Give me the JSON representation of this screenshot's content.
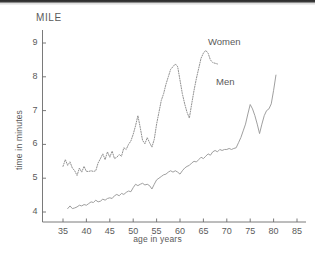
{
  "figure": {
    "title": "MILE",
    "background": "#ffffff",
    "ink_color": "#6b6b6b"
  },
  "annotations": {
    "women_label": "Women",
    "men_label": "Men"
  },
  "chart_data": {
    "type": "line",
    "title": "MILE",
    "xlabel": "age in years",
    "ylabel": "time in minutes",
    "xlim": [
      31,
      88
    ],
    "ylim": [
      3.55,
      9.4
    ],
    "xticks": [
      35,
      40,
      45,
      50,
      55,
      60,
      65,
      70,
      75,
      80,
      85
    ],
    "yticks": [
      4,
      5,
      6,
      7,
      8,
      9
    ],
    "grid": false,
    "legend": "inline-annotation",
    "series": [
      {
        "name": "Women",
        "linestyle": "dotted",
        "color": "#8a8a8a",
        "x": [
          35,
          35.5,
          36,
          36.5,
          37,
          37.5,
          38,
          38.5,
          39,
          39.5,
          40,
          40.5,
          41,
          41.5,
          42,
          42.5,
          43,
          43.5,
          44,
          44.5,
          45,
          45.5,
          46,
          46.5,
          47,
          47.5,
          48,
          48.5,
          49,
          49.5,
          50,
          50.5,
          51,
          51.5,
          52,
          52.5,
          53,
          53.5,
          54,
          54.5,
          55,
          55.5,
          56,
          56.5,
          57,
          57.5,
          58,
          58.5,
          59,
          59.5,
          60,
          60.5,
          61,
          61.5,
          62,
          62.5,
          63,
          63.5,
          64,
          64.5,
          65,
          65.5,
          66,
          66.5,
          67,
          67.5,
          68
        ],
        "y": [
          5.35,
          5.55,
          5.38,
          5.48,
          5.3,
          5.22,
          5.08,
          5.3,
          5.18,
          5.35,
          5.2,
          5.2,
          5.22,
          5.2,
          5.22,
          5.45,
          5.58,
          5.72,
          5.55,
          5.78,
          5.62,
          5.8,
          5.58,
          5.62,
          5.7,
          5.65,
          5.9,
          5.85,
          6.0,
          6.1,
          6.3,
          6.55,
          6.85,
          6.5,
          6.12,
          6.02,
          6.2,
          6.05,
          5.92,
          6.15,
          6.6,
          6.95,
          7.3,
          7.5,
          7.78,
          8.0,
          8.22,
          8.3,
          8.38,
          8.3,
          7.9,
          7.5,
          7.2,
          6.95,
          6.78,
          7.2,
          7.6,
          7.95,
          8.25,
          8.55,
          8.7,
          8.78,
          8.7,
          8.5,
          8.42,
          8.4,
          8.38
        ]
      },
      {
        "name": "Men",
        "linestyle": "solid",
        "color": "#9a9a9a",
        "x": [
          36,
          36.5,
          37,
          37.5,
          38,
          38.5,
          39,
          39.5,
          40,
          40.5,
          41,
          41.5,
          42,
          42.5,
          43,
          43.5,
          44,
          44.5,
          45,
          45.5,
          46,
          46.5,
          47,
          47.5,
          48,
          48.5,
          49,
          49.5,
          50,
          50.5,
          51,
          51.5,
          52,
          52.5,
          53,
          53.5,
          54,
          54.5,
          55,
          55.5,
          56,
          56.5,
          57,
          57.5,
          58,
          58.5,
          59,
          59.5,
          60,
          60.5,
          61,
          61.5,
          62,
          62.5,
          63,
          63.5,
          64,
          64.5,
          65,
          65.5,
          66,
          66.5,
          67,
          67.5,
          68,
          68.5,
          69,
          69.5,
          70,
          70.5,
          71,
          71.5,
          72,
          72.5,
          73,
          73.5,
          74,
          74.5,
          75,
          75.5,
          76,
          76.5,
          77,
          77.5,
          78,
          78.5,
          79,
          79.5,
          80,
          80.5
        ],
        "y": [
          4.1,
          4.18,
          4.1,
          4.12,
          4.15,
          4.2,
          4.18,
          4.22,
          4.2,
          4.25,
          4.3,
          4.28,
          4.35,
          4.3,
          4.32,
          4.38,
          4.35,
          4.4,
          4.42,
          4.4,
          4.48,
          4.52,
          4.48,
          4.55,
          4.52,
          4.58,
          4.62,
          4.6,
          4.72,
          4.82,
          4.78,
          4.82,
          4.85,
          4.8,
          4.82,
          4.78,
          4.68,
          4.82,
          4.95,
          5.0,
          5.05,
          5.1,
          5.12,
          5.18,
          5.22,
          5.18,
          5.22,
          5.18,
          5.12,
          5.22,
          5.3,
          5.35,
          5.38,
          5.45,
          5.5,
          5.48,
          5.55,
          5.62,
          5.58,
          5.65,
          5.72,
          5.68,
          5.78,
          5.82,
          5.78,
          5.85,
          5.82,
          5.85,
          5.85,
          5.88,
          5.85,
          5.88,
          5.9,
          6.05,
          6.2,
          6.4,
          6.6,
          6.9,
          7.18,
          7.05,
          6.85,
          6.6,
          6.32,
          6.6,
          6.85,
          7.0,
          7.05,
          7.2,
          7.6,
          8.05
        ]
      }
    ]
  }
}
